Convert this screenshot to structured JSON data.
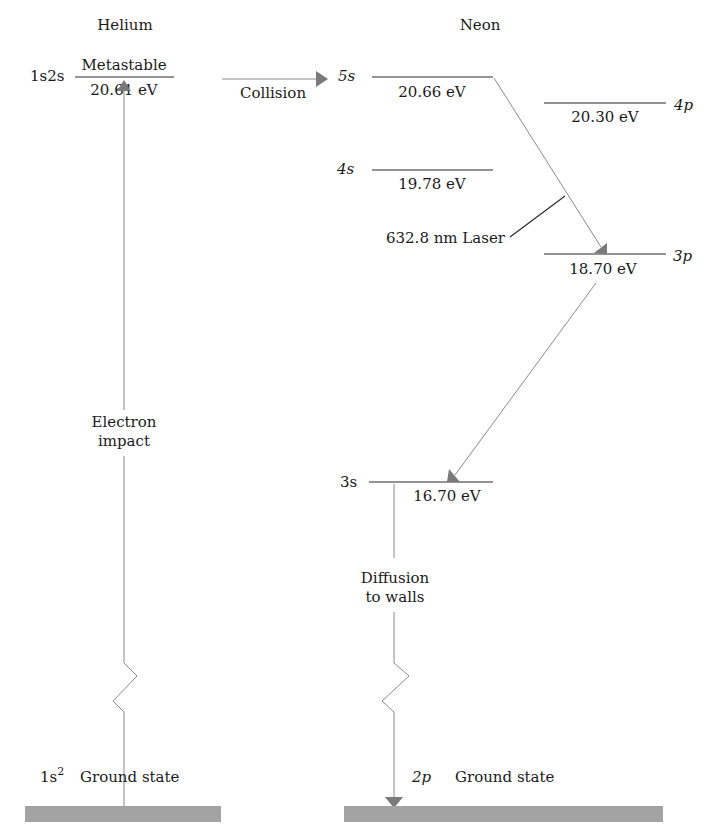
{
  "helium": {
    "heading": "Helium",
    "metastable": {
      "config": "1s2s",
      "label": "Metastable",
      "energy": "20.61 eV"
    },
    "excitation_label_line1": "Electron",
    "excitation_label_line2": "impact",
    "ground": {
      "config": "1s",
      "config_sup": "2",
      "label": "Ground state"
    }
  },
  "transfer": {
    "label": "Collision"
  },
  "neon": {
    "heading": "Neon",
    "levels": [
      {
        "name": "5s",
        "energy": "20.66 eV"
      },
      {
        "name": "4p",
        "energy": "20.30 eV"
      },
      {
        "name": "4s",
        "energy": "19.78 eV"
      },
      {
        "name": "3p",
        "energy": "18.70 eV"
      },
      {
        "name": "3s",
        "energy": "16.70 eV"
      }
    ],
    "laser_label": "632.8 nm Laser",
    "decay_label_line1": "Diffusion",
    "decay_label_line2": "to walls",
    "ground": {
      "config": "2p",
      "label": "Ground state"
    }
  },
  "colors": {
    "level_line": "#2a2a2a",
    "transition_line": "#8a8a8a",
    "arrowhead": "#7a7a7a",
    "ground_bar": "#a3a3a3"
  }
}
